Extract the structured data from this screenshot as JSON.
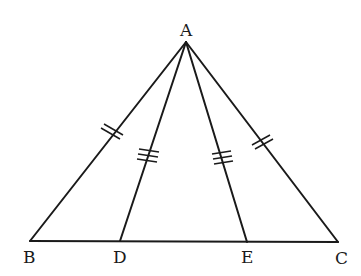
{
  "diagram": {
    "type": "triangle-geometry",
    "points": {
      "A": {
        "label": "A",
        "x": 186,
        "y": 42
      },
      "B": {
        "label": "B",
        "x": 30,
        "y": 241
      },
      "C": {
        "label": "C",
        "x": 338,
        "y": 242
      },
      "D": {
        "label": "D",
        "x": 120,
        "y": 241
      },
      "E": {
        "label": "E",
        "x": 247,
        "y": 242
      }
    },
    "segments": [
      {
        "from": "A",
        "to": "B",
        "ticks": 2
      },
      {
        "from": "A",
        "to": "C",
        "ticks": 2
      },
      {
        "from": "A",
        "to": "D",
        "ticks": 3
      },
      {
        "from": "A",
        "to": "E",
        "ticks": 3
      },
      {
        "from": "B",
        "to": "C",
        "ticks": 0
      }
    ],
    "labels": {
      "A": "A",
      "B": "B",
      "C": "C",
      "D": "D",
      "E": "E"
    },
    "line_color": "#1a1a1a"
  }
}
